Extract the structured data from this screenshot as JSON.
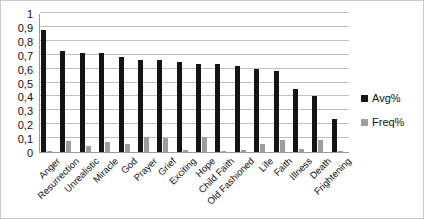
{
  "chart_data": {
    "type": "bar",
    "title": "",
    "xlabel": "",
    "ylabel": "",
    "ylim": [
      0,
      1
    ],
    "grid": true,
    "legend_position": "right",
    "categories": [
      "Anger",
      "Resurrection",
      "Unrealistic",
      "Miracle",
      "God",
      "Prayer",
      "Grief",
      "Exciting",
      "Hope",
      "Child Faith",
      "Old Fashioned",
      "Life",
      "Faith",
      "Illness",
      "Death",
      "Frightening"
    ],
    "y_ticks": [
      "0",
      "0,1",
      "0,2",
      "0,3",
      "0,4",
      "0,5",
      "0,6",
      "0,7",
      "0,8",
      "0,9",
      "1"
    ],
    "y_tick_values": [
      0,
      0.1,
      0.2,
      0.3,
      0.4,
      0.5,
      0.6,
      0.7,
      0.8,
      0.9,
      1
    ],
    "series": [
      {
        "name": "Avg%",
        "color": "#151515",
        "values": [
          0.88,
          0.73,
          0.71,
          0.71,
          0.68,
          0.66,
          0.66,
          0.645,
          0.635,
          0.63,
          0.62,
          0.595,
          0.585,
          0.455,
          0.405,
          0.235
        ]
      },
      {
        "name": "Freq%",
        "color": "#9d9d9d",
        "values": [
          0.005,
          0.08,
          0.045,
          0.075,
          0.06,
          0.11,
          0.1,
          0.015,
          0.11,
          0.005,
          0.015,
          0.055,
          0.085,
          0.02,
          0.085,
          0.005
        ]
      }
    ]
  }
}
